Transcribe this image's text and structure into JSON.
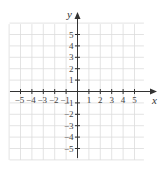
{
  "diagram": {
    "type": "coordinate-plane",
    "x_axis": {
      "label": "x",
      "ticks": [
        -5,
        -4,
        -3,
        -2,
        -1,
        1,
        2,
        3,
        4,
        5
      ]
    },
    "y_axis": {
      "label": "y",
      "ticks": [
        5,
        4,
        3,
        2,
        1,
        -1,
        -2,
        -3,
        -4,
        -5
      ]
    },
    "grid": {
      "min": -6,
      "max": 6,
      "color": "#dcdcdc"
    },
    "axis_color": "#333333"
  }
}
